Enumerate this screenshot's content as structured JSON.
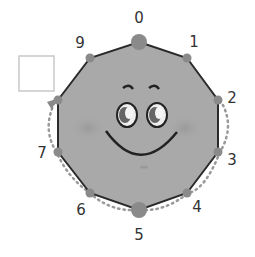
{
  "diagram": {
    "type": "decagon-clock-face",
    "vertex_labels": [
      "0",
      "1",
      "2",
      "3",
      "4",
      "5",
      "6",
      "7",
      "8",
      "9"
    ],
    "visible_labels": [
      {
        "text": "0",
        "x": 139,
        "y": 18
      },
      {
        "text": "1",
        "x": 194,
        "y": 42
      },
      {
        "text": "2",
        "x": 232,
        "y": 98
      },
      {
        "text": "3",
        "x": 232,
        "y": 160
      },
      {
        "text": "4",
        "x": 197,
        "y": 207
      },
      {
        "text": "5",
        "x": 139,
        "y": 235
      },
      {
        "text": "6",
        "x": 81,
        "y": 208
      },
      {
        "text": "7",
        "x": 42,
        "y": 153
      },
      {
        "text": "9",
        "x": 80,
        "y": 42
      }
    ],
    "answer_box": {
      "label": "",
      "x": 18,
      "y": 55,
      "w": 36,
      "h": 36
    },
    "path": {
      "style": "dotted",
      "from": "2",
      "to": "8",
      "direction": "clockwise",
      "arrow_at": "8"
    },
    "colors": {
      "shape_fill": "#a9a9a9",
      "vertex_dot": "#8a8a8a",
      "edge": "#2a2a2a",
      "dotted_path": "#999999",
      "box_border": "#c8c8c8"
    }
  }
}
